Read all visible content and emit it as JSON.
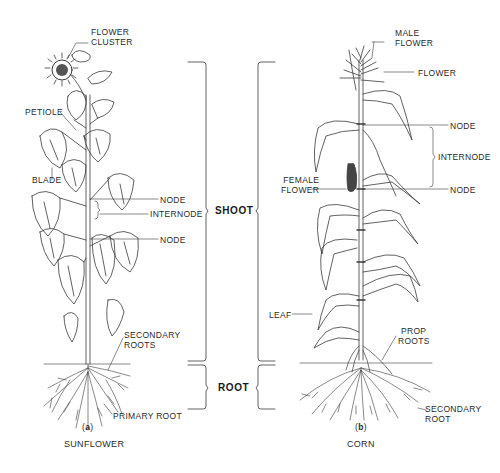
{
  "figure": {
    "regions": {
      "shoot": "SHOOT",
      "root": "ROOT"
    },
    "panels": [
      {
        "id": "a",
        "part_label": "a",
        "caption": "SUNFLOWER",
        "labels": {
          "flower_cluster_1": "FLOWER",
          "flower_cluster_2": "CLUSTER",
          "petiole": "PETIOLE",
          "blade": "BLADE",
          "node_upper": "NODE",
          "internode": "INTERNODE",
          "node_lower": "NODE",
          "secondary_roots_1": "SECONDARY",
          "secondary_roots_2": "ROOTS",
          "primary_root": "PRIMARY  ROOT"
        }
      },
      {
        "id": "b",
        "part_label": "b",
        "caption": "CORN",
        "labels": {
          "male_flower_1": "MALE",
          "male_flower_2": "FLOWER",
          "flower": "FLOWER",
          "node_upper": "NODE",
          "internode": "INTERNODE",
          "female_flower_1": "FEMALE",
          "female_flower_2": "FLOWER",
          "node_lower": "NODE",
          "leaf": "LEAF",
          "prop_roots_1": "PROP",
          "prop_roots_2": "ROOTS",
          "secondary_root_1": "SECONDARY",
          "secondary_root_2": "ROOT"
        }
      }
    ],
    "colors": {
      "ink": "#2a2a2a",
      "background": "#ffffff"
    }
  }
}
